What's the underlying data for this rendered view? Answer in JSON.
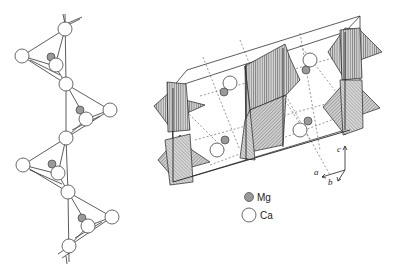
{
  "diagram": {
    "left_panel": {
      "description": "zigzag chain of Ca atoms with Mg atoms",
      "ca_atoms": [
        {
          "x": 65,
          "y": 29
        },
        {
          "x": 22,
          "y": 56
        },
        {
          "x": 55,
          "y": 66
        },
        {
          "x": 66,
          "y": 84
        },
        {
          "x": 110,
          "y": 110
        },
        {
          "x": 86,
          "y": 119
        },
        {
          "x": 66,
          "y": 138
        },
        {
          "x": 23,
          "y": 165
        },
        {
          "x": 58,
          "y": 174
        },
        {
          "x": 68,
          "y": 192
        },
        {
          "x": 112,
          "y": 217
        },
        {
          "x": 88,
          "y": 226
        },
        {
          "x": 69,
          "y": 246
        }
      ],
      "mg_atoms": [
        {
          "x": 51,
          "y": 57
        },
        {
          "x": 80,
          "y": 110
        },
        {
          "x": 52,
          "y": 164
        },
        {
          "x": 82,
          "y": 218
        }
      ]
    },
    "right_panel": {
      "description": "unit cell with polyhedra, Mg and Ca atoms"
    },
    "legend": {
      "items": [
        {
          "label": "Mg",
          "fill": "#999999"
        },
        {
          "label": "Ca",
          "fill": "#ffffff"
        }
      ]
    },
    "axes": {
      "a": "a",
      "b": "b",
      "c": "c"
    }
  }
}
